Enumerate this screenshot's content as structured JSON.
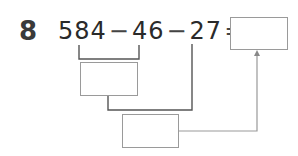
{
  "problem": {
    "number": "8",
    "terms": [
      "584",
      "46",
      "27"
    ],
    "operators": [
      "−",
      "−",
      "="
    ]
  },
  "boxes": {
    "answer": "",
    "step1": "",
    "step2": ""
  },
  "colors": {
    "text": "#2a2a2a",
    "bracket_dark": "#555555",
    "arrow": "#999999",
    "box_border": "#9a9a9a"
  }
}
